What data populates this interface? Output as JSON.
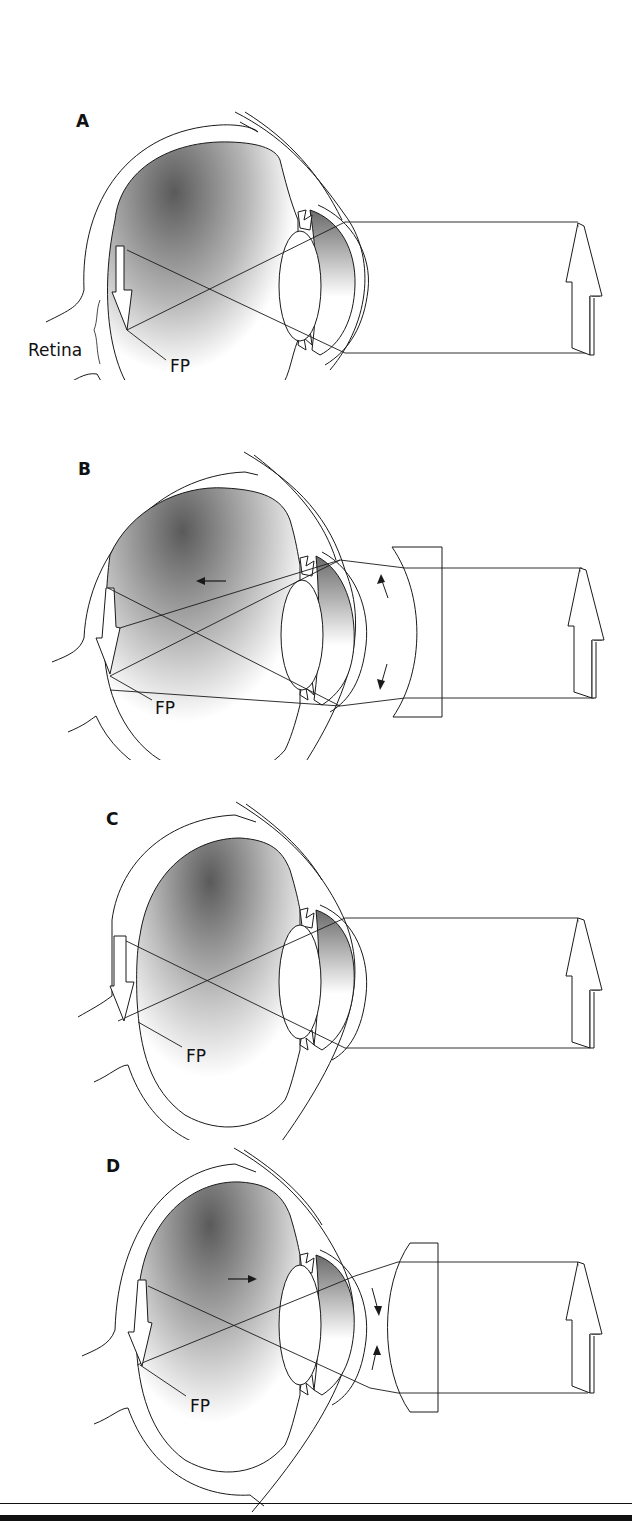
{
  "figure": {
    "panels": [
      {
        "id": "A",
        "label": "A",
        "callouts": {
          "retina": "Retina",
          "fp": "FP"
        },
        "corrective_lens": "none",
        "description": "emmetropic eye, image focused on retina"
      },
      {
        "id": "B",
        "label": "B",
        "callouts": {
          "fp": "FP"
        },
        "corrective_lens": "concave",
        "description": "myopic eye corrected with concave lens"
      },
      {
        "id": "C",
        "label": "C",
        "callouts": {
          "fp": "FP"
        },
        "corrective_lens": "none",
        "description": "hyperopic eye, focal point behind retina"
      },
      {
        "id": "D",
        "label": "D",
        "callouts": {
          "fp": "FP"
        },
        "corrective_lens": "convex",
        "description": "hyperopic eye corrected with convex lens"
      }
    ]
  },
  "colors": {
    "line": "#1a1a1a",
    "shade_dark": "#5a5a5a",
    "shade_light": "#ffffff",
    "background": "#ffffff"
  }
}
